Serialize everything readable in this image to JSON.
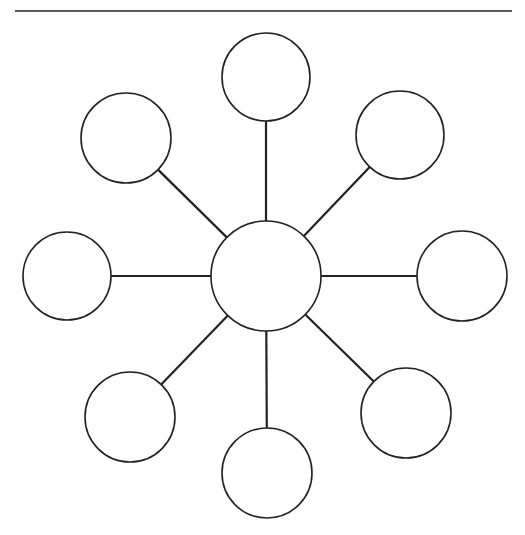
{
  "diagram": {
    "type": "hub-and-spoke web",
    "stroke_color": "#222222",
    "fill_color": "#ffffff",
    "top_rule": {
      "x1": 15,
      "x2": 512,
      "y": 11
    },
    "center_node": {
      "id": "center",
      "cx": 266,
      "cy": 276,
      "r": 55,
      "label": ""
    },
    "spoke_nodes": [
      {
        "id": "top",
        "cx": 266,
        "cy": 77,
        "r": 44,
        "label": ""
      },
      {
        "id": "top-right",
        "cx": 400,
        "cy": 135,
        "r": 44,
        "label": ""
      },
      {
        "id": "right",
        "cx": 462,
        "cy": 276,
        "r": 45,
        "label": ""
      },
      {
        "id": "bottom-right",
        "cx": 406,
        "cy": 413,
        "r": 45,
        "label": ""
      },
      {
        "id": "bottom",
        "cx": 267,
        "cy": 473,
        "r": 45,
        "label": ""
      },
      {
        "id": "bottom-left",
        "cx": 130,
        "cy": 417,
        "r": 45,
        "label": ""
      },
      {
        "id": "left",
        "cx": 67,
        "cy": 276,
        "r": 44,
        "label": ""
      },
      {
        "id": "top-left",
        "cx": 126,
        "cy": 138,
        "r": 45,
        "label": ""
      }
    ]
  }
}
